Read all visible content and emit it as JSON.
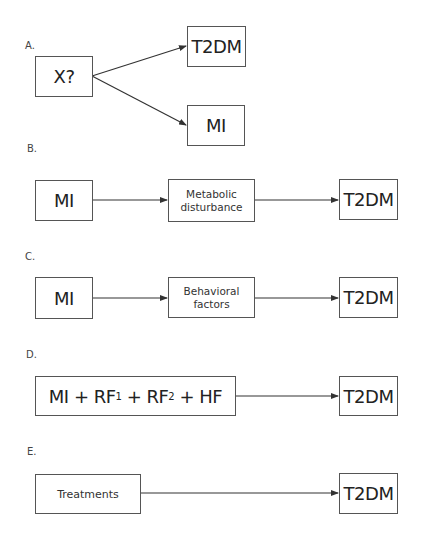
{
  "panels": {
    "A": {
      "label": "A.",
      "source": "X?",
      "targets": [
        "T2DM",
        "MI"
      ]
    },
    "B": {
      "label": "B.",
      "source": "MI",
      "mediator_line1": "Metabolic",
      "mediator_line2": "disturbance",
      "target": "T2DM"
    },
    "C": {
      "label": "C.",
      "source": "MI",
      "mediator_line1": "Behavioral",
      "mediator_line2": "factors",
      "target": "T2DM"
    },
    "D": {
      "label": "D.",
      "source_parts": {
        "mi": "MI + RF",
        "sub1": "1",
        "plus1": " + RF",
        "sub2": "2",
        "plus2": " + HF"
      },
      "target": "T2DM"
    },
    "E": {
      "label": "E.",
      "source": "Treatments",
      "target": "T2DM"
    }
  },
  "colors": {
    "line": "#333333",
    "border": "#555555"
  }
}
